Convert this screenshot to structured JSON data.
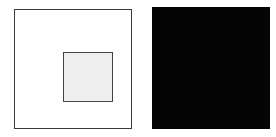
{
  "figure": {
    "canvas": {
      "width": 276,
      "height": 137,
      "background_color": "#ffffff"
    },
    "panels": [
      {
        "id": "left",
        "name": "light-surround-panel",
        "surround_label": "White surround",
        "surround_color": "#ffffff",
        "surround_border_color": "#3a3a3a",
        "surround_border_width": 1,
        "x": 14,
        "y": 9,
        "width": 118,
        "height": 120,
        "swatch": {
          "name": "gray-swatch-on-white",
          "label": "Gray test square",
          "fill_color": "#efefef",
          "border_color": "#444444",
          "border_width": 1,
          "x": 48,
          "y": 42,
          "width": 50,
          "height": 50
        }
      },
      {
        "id": "right",
        "name": "dark-surround-panel",
        "surround_label": "Black surround",
        "surround_color": "#050505",
        "surround_border_color": "#050505",
        "surround_border_width": 0,
        "x": 152,
        "y": 7,
        "width": 118,
        "height": 122,
        "swatch": {
          "name": "gray-swatch-on-black",
          "label": "Gray test square",
          "fill_color": "#ededed",
          "border_color": "#ededed",
          "border_width": 0,
          "x": 186,
          "y": 42,
          "width": 49,
          "height": 50
        }
      }
    ]
  }
}
